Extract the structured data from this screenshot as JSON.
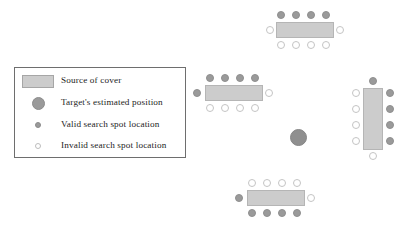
{
  "figure": {
    "width": 404,
    "height": 226,
    "background": "#ffffff"
  },
  "colors": {
    "cover_fill": "#cccccc",
    "cover_stroke": "#b5b5b5",
    "valid_fill": "#9a9a9a",
    "valid_stroke": "#8f8f8f",
    "invalid_fill": "#ffffff",
    "invalid_stroke": "#c4c4c4",
    "target_fill": "#8f8f8f",
    "legend_border": "#6e6e6e",
    "text": "#1d1d1d"
  },
  "legend": {
    "box": {
      "x": 14,
      "y": 67,
      "width": 172,
      "height": 91
    },
    "items": [
      {
        "symbol": "cover-swatch",
        "label": "Source of cover"
      },
      {
        "symbol": "target-circle",
        "label": "Target's estimated position"
      },
      {
        "symbol": "valid-dot",
        "label": "Valid search spot location"
      },
      {
        "symbol": "invalid-circle",
        "label": "Invalid search spot location"
      }
    ]
  },
  "scene": {
    "target": {
      "cx": 298,
      "cy": 137,
      "r": 8.5
    },
    "covers": [
      {
        "name": "cover-top",
        "x": 276,
        "y": 22,
        "width": 58,
        "height": 16,
        "orientation": "horizontal"
      },
      {
        "name": "cover-left",
        "x": 205,
        "y": 85,
        "width": 58,
        "height": 16,
        "orientation": "horizontal"
      },
      {
        "name": "cover-right",
        "x": 363,
        "y": 88,
        "width": 20,
        "height": 62,
        "orientation": "vertical"
      },
      {
        "name": "cover-bottom",
        "x": 247,
        "y": 190,
        "width": 58,
        "height": 16,
        "orientation": "horizontal"
      }
    ],
    "spots": [
      {
        "group": "top",
        "type": "valid",
        "cx": 281,
        "cy": 15
      },
      {
        "group": "top",
        "type": "valid",
        "cx": 296,
        "cy": 15
      },
      {
        "group": "top",
        "type": "valid",
        "cx": 311,
        "cy": 15
      },
      {
        "group": "top",
        "type": "valid",
        "cx": 326,
        "cy": 15
      },
      {
        "group": "top",
        "type": "invalid",
        "cx": 270,
        "cy": 30
      },
      {
        "group": "top",
        "type": "invalid",
        "cx": 340,
        "cy": 30
      },
      {
        "group": "top",
        "type": "invalid",
        "cx": 281,
        "cy": 45
      },
      {
        "group": "top",
        "type": "invalid",
        "cx": 296,
        "cy": 45
      },
      {
        "group": "top",
        "type": "invalid",
        "cx": 311,
        "cy": 45
      },
      {
        "group": "top",
        "type": "invalid",
        "cx": 326,
        "cy": 45
      },
      {
        "group": "left",
        "type": "valid",
        "cx": 210,
        "cy": 78
      },
      {
        "group": "left",
        "type": "valid",
        "cx": 225,
        "cy": 78
      },
      {
        "group": "left",
        "type": "valid",
        "cx": 240,
        "cy": 78
      },
      {
        "group": "left",
        "type": "valid",
        "cx": 255,
        "cy": 78
      },
      {
        "group": "left",
        "type": "valid",
        "cx": 197,
        "cy": 93
      },
      {
        "group": "left",
        "type": "invalid",
        "cx": 269,
        "cy": 93
      },
      {
        "group": "left",
        "type": "invalid",
        "cx": 210,
        "cy": 108
      },
      {
        "group": "left",
        "type": "invalid",
        "cx": 225,
        "cy": 108
      },
      {
        "group": "left",
        "type": "invalid",
        "cx": 240,
        "cy": 108
      },
      {
        "group": "left",
        "type": "invalid",
        "cx": 255,
        "cy": 108
      },
      {
        "group": "right",
        "type": "valid",
        "cx": 373,
        "cy": 81
      },
      {
        "group": "right",
        "type": "invalid",
        "cx": 356,
        "cy": 93
      },
      {
        "group": "right",
        "type": "invalid",
        "cx": 356,
        "cy": 109
      },
      {
        "group": "right",
        "type": "invalid",
        "cx": 356,
        "cy": 125
      },
      {
        "group": "right",
        "type": "invalid",
        "cx": 356,
        "cy": 141
      },
      {
        "group": "right",
        "type": "valid",
        "cx": 390,
        "cy": 93
      },
      {
        "group": "right",
        "type": "valid",
        "cx": 390,
        "cy": 109
      },
      {
        "group": "right",
        "type": "valid",
        "cx": 390,
        "cy": 125
      },
      {
        "group": "right",
        "type": "valid",
        "cx": 390,
        "cy": 141
      },
      {
        "group": "right",
        "type": "invalid",
        "cx": 373,
        "cy": 156
      },
      {
        "group": "bottom",
        "type": "invalid",
        "cx": 252,
        "cy": 183
      },
      {
        "group": "bottom",
        "type": "invalid",
        "cx": 267,
        "cy": 183
      },
      {
        "group": "bottom",
        "type": "invalid",
        "cx": 282,
        "cy": 183
      },
      {
        "group": "bottom",
        "type": "invalid",
        "cx": 297,
        "cy": 183
      },
      {
        "group": "bottom",
        "type": "valid",
        "cx": 239,
        "cy": 198
      },
      {
        "group": "bottom",
        "type": "invalid",
        "cx": 311,
        "cy": 198
      },
      {
        "group": "bottom",
        "type": "valid",
        "cx": 252,
        "cy": 213
      },
      {
        "group": "bottom",
        "type": "valid",
        "cx": 267,
        "cy": 213
      },
      {
        "group": "bottom",
        "type": "valid",
        "cx": 282,
        "cy": 213
      },
      {
        "group": "bottom",
        "type": "valid",
        "cx": 297,
        "cy": 213
      }
    ]
  }
}
